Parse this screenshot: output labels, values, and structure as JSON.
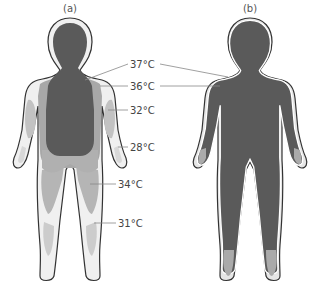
{
  "diagram": {
    "panels": [
      {
        "id": "a",
        "label": "(a)",
        "description": "Body temperature distribution in cold environment"
      },
      {
        "id": "b",
        "label": "(b)",
        "description": "Body temperature distribution in warm environment"
      }
    ],
    "temperature_labels": [
      {
        "text": "37°C",
        "zone": "core"
      },
      {
        "text": "36°C",
        "zone": "shell"
      },
      {
        "text": "32°C",
        "zone": "upper-arm"
      },
      {
        "text": "28°C",
        "zone": "hand"
      },
      {
        "text": "34°C",
        "zone": "thigh"
      },
      {
        "text": "31°C",
        "zone": "lower-leg"
      }
    ],
    "colors": {
      "core_37": "#5a5a5a",
      "zone_36": "#a8a8a8",
      "zone_34": "#b5b5b5",
      "zone_32": "#c2c2c2",
      "zone_31": "#cccccc",
      "skin_light": "#ececec",
      "outline": "#333333"
    }
  }
}
